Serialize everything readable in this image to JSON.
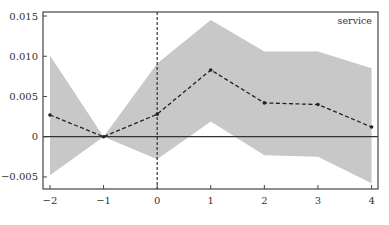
{
  "chart_data": {
    "type": "line",
    "title": "",
    "panel_label": "service",
    "xlabel": "",
    "ylabel": "",
    "x": [
      -2,
      -1,
      0,
      1,
      2,
      3,
      4
    ],
    "xlim": [
      -2.13,
      4.12
    ],
    "ylim": [
      -0.0065,
      0.0155
    ],
    "xticks": [
      "-2",
      "-1",
      "0",
      "1",
      "2",
      "3",
      "4"
    ],
    "yticks": [
      {
        "value": 0.015,
        "label": "0.015"
      },
      {
        "value": 0.01,
        "label": "0.010"
      },
      {
        "value": 0.005,
        "label": "0.005"
      },
      {
        "value": 0,
        "label": "0"
      },
      {
        "value": -0.005,
        "label": "-0.005"
      }
    ],
    "series": [
      {
        "name": "estimate",
        "style": "dashed-with-markers",
        "values": [
          0.0027,
          0.0,
          0.0028,
          0.0083,
          0.0042,
          0.004,
          0.0012
        ]
      },
      {
        "name": "ci_upper",
        "style": "band-upper",
        "values": [
          0.0101,
          0.0,
          0.0091,
          0.0145,
          0.0106,
          0.0106,
          0.0085
        ]
      },
      {
        "name": "ci_lower",
        "style": "band-lower",
        "values": [
          -0.0048,
          0.0,
          -0.0028,
          0.0019,
          -0.0023,
          -0.0025,
          -0.0058
        ]
      }
    ],
    "reference_lines": {
      "horizontal_y": 0,
      "vertical_x_dashed": 0
    },
    "grid": false,
    "legend": "none",
    "colors": {
      "band": "#c8c8c8",
      "line": "#222222",
      "axis": "#444444",
      "zero_line": "#333333"
    }
  }
}
